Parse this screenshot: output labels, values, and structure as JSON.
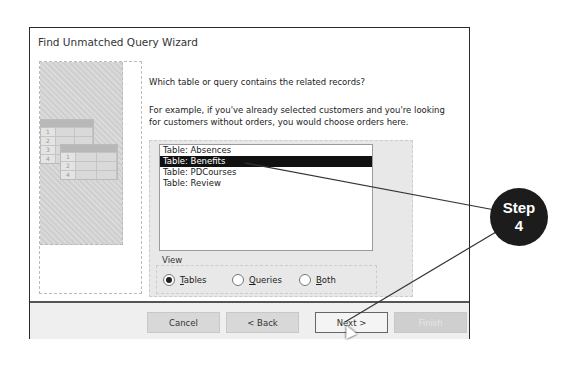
{
  "dialog": {
    "title": "Find Unmatched Query Wizard",
    "question": "Which table or query contains the related records?",
    "example": "For example, if you've already selected customers and you're looking for customers without orders, you would choose orders here."
  },
  "illustration": {
    "grid1_rows": [
      "1",
      "2",
      "3",
      "4"
    ],
    "grid2_rows": [
      "1",
      "2",
      "4"
    ]
  },
  "list": {
    "items": [
      "Table: Absences",
      "Table: Benefits",
      "Table: PDCourses",
      "Table: Review"
    ],
    "selected_index": 1
  },
  "view": {
    "label": "View",
    "options": [
      {
        "label": "Tables",
        "underline": "T",
        "rest": "ables",
        "selected": true
      },
      {
        "label": "Queries",
        "underline": "Q",
        "rest": "ueries",
        "selected": false
      },
      {
        "label": "Both",
        "underline": "B",
        "rest": "oth",
        "selected": false
      }
    ]
  },
  "buttons": {
    "cancel": "Cancel",
    "back": "< Back",
    "next": "Next >",
    "finish": "Finish"
  },
  "callout": {
    "line1": "Step",
    "line2": "4",
    "color": "#1c1c1c"
  }
}
